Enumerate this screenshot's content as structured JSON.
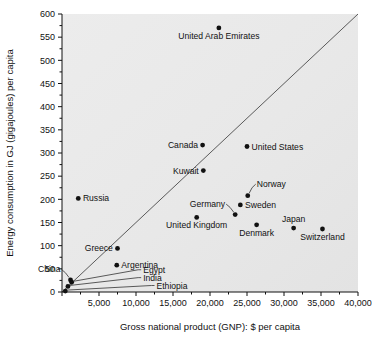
{
  "chart_data": {
    "type": "scatter",
    "title": "",
    "xlabel": "Gross national product (GNP): $ per capita",
    "ylabel": "Energy consumption in GJ (gigajoules) per capita",
    "xlim": [
      0,
      40000
    ],
    "ylim": [
      0,
      600
    ],
    "xticks": [
      0,
      5000,
      10000,
      15000,
      20000,
      25000,
      30000,
      35000,
      40000
    ],
    "xtick_labels": [
      "",
      "5,000",
      "10,000",
      "15,000",
      "20,000",
      "25,000",
      "30,000",
      "35,000",
      "40,000"
    ],
    "xminor_step": 2500,
    "yticks": [
      0,
      50,
      100,
      150,
      200,
      250,
      300,
      350,
      400,
      450,
      500,
      550,
      600
    ],
    "ytick_labels": [
      "0",
      "50",
      "100",
      "150",
      "200",
      "250",
      "300",
      "350",
      "400",
      "450",
      "500",
      "550",
      "600"
    ],
    "yminor_step": 25,
    "grid": false,
    "legend": "none",
    "reference_line": {
      "name": "diagonal-reference-line",
      "from": [
        0,
        0
      ],
      "to": [
        40000,
        600
      ]
    },
    "points": [
      {
        "label": "United Arab Emirates",
        "x": 21200,
        "y": 570,
        "label_pos": "below"
      },
      {
        "label": "Canada",
        "x": 19000,
        "y": 317,
        "label_pos": "left"
      },
      {
        "label": "United States",
        "x": 25000,
        "y": 314,
        "label_pos": "right"
      },
      {
        "label": "Kuwait",
        "x": 19100,
        "y": 262,
        "label_pos": "left"
      },
      {
        "label": "Russia",
        "x": 2200,
        "y": 202,
        "label_pos": "right"
      },
      {
        "label": "Norway",
        "x": 25100,
        "y": 208,
        "label_pos": "leader-upright"
      },
      {
        "label": "Sweden",
        "x": 24100,
        "y": 188,
        "label_pos": "right"
      },
      {
        "label": "Germany",
        "x": 23400,
        "y": 167,
        "label_pos": "leader-upleft"
      },
      {
        "label": "United Kingdom",
        "x": 18200,
        "y": 161,
        "label_pos": "below"
      },
      {
        "label": "Denmark",
        "x": 26300,
        "y": 145,
        "label_pos": "below"
      },
      {
        "label": "Japan",
        "x": 31300,
        "y": 138,
        "label_pos": "above"
      },
      {
        "label": "Switzerland",
        "x": 35200,
        "y": 136,
        "label_pos": "below"
      },
      {
        "label": "Greece",
        "x": 7500,
        "y": 94,
        "label_pos": "left"
      },
      {
        "label": "Argentina",
        "x": 7400,
        "y": 58,
        "label_pos": "right"
      },
      {
        "label": "China",
        "x": 1150,
        "y": 26,
        "label_pos": "leader-upleft"
      },
      {
        "label": "Egypt",
        "x": 1300,
        "y": 21,
        "label_pos": "leader-right"
      },
      {
        "label": "India",
        "x": 800,
        "y": 12,
        "label_pos": "leader-right"
      },
      {
        "label": "Ethiopia",
        "x": 450,
        "y": 2,
        "label_pos": "leader-right"
      }
    ]
  },
  "style": {
    "plot_background": "#e9e9e9",
    "page_background": "#ffffff",
    "marker_color": "#111111",
    "axis_color": "#111111",
    "reference_line_color": "#4a4a4a"
  }
}
